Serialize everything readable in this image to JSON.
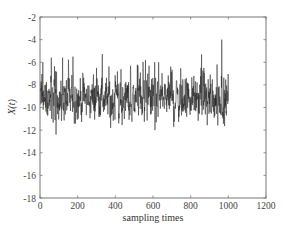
{
  "chart_data": {
    "type": "line",
    "title": "",
    "xlabel": "sampling times",
    "ylabel": "X(t)",
    "xlim": [
      0,
      1200
    ],
    "ylim": [
      -18,
      -2
    ],
    "x_ticks": [
      0,
      200,
      400,
      600,
      800,
      1000,
      1200
    ],
    "y_ticks": [
      -2,
      -4,
      -6,
      -8,
      -10,
      -12,
      -14,
      -16,
      -18
    ],
    "x_tick_labels": [
      "0",
      "200",
      "400",
      "600",
      "800",
      "1000",
      "1200"
    ],
    "y_tick_labels": [
      "-2",
      "-4",
      "-6",
      "-8",
      "-10",
      "-12",
      "-14",
      "-16",
      "-18"
    ],
    "grid": false,
    "legend": null,
    "series": [
      {
        "name": "X(t)",
        "color": "#222222",
        "n_samples": 1000,
        "x_range": [
          1,
          1000
        ],
        "mean": -9.2,
        "approx_min": -12.5,
        "approx_max": -4.0,
        "notable_peaks": [
          {
            "x": 15,
            "y": -6.0
          },
          {
            "x": 60,
            "y": -5.6
          },
          {
            "x": 85,
            "y": -12.4
          },
          {
            "x": 120,
            "y": -5.6
          },
          {
            "x": 175,
            "y": -5.5
          },
          {
            "x": 300,
            "y": -6.5
          },
          {
            "x": 330,
            "y": -6.0
          },
          {
            "x": 375,
            "y": -11.8
          },
          {
            "x": 520,
            "y": -6.3
          },
          {
            "x": 560,
            "y": -5.8
          },
          {
            "x": 610,
            "y": -12.0
          },
          {
            "x": 630,
            "y": -6.0
          },
          {
            "x": 870,
            "y": -6.5
          },
          {
            "x": 940,
            "y": -6.2
          },
          {
            "x": 965,
            "y": -4.0
          },
          {
            "x": 990,
            "y": -10.7
          }
        ]
      }
    ]
  }
}
